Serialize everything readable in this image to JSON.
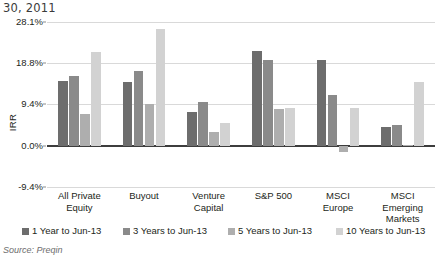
{
  "heading": "30, 2011",
  "source_note": "Source: Preqin",
  "chart_data": {
    "type": "bar",
    "title": "30, 2011",
    "xlabel": "",
    "ylabel": "IRR",
    "ylim": [
      -9.4,
      28.1
    ],
    "grid": true,
    "legend_position": "bottom",
    "ytick_labels": [
      "28.1%",
      "18.8%",
      "9.4%",
      "0.0%",
      "-9.4%"
    ],
    "ytick_values": [
      28.1,
      18.8,
      9.4,
      0.0,
      -9.4
    ],
    "categories": [
      "All Private Equity",
      "Buyout",
      "Venture Capital",
      "S&P 500",
      "MSCI Europe",
      "MSCI Emerging Markets"
    ],
    "category_lines": [
      [
        "All Private",
        "Equity"
      ],
      [
        "Buyout"
      ],
      [
        "Venture",
        "Capital"
      ],
      [
        "S&P 500"
      ],
      [
        "MSCI",
        "Europe"
      ],
      [
        "MSCI",
        "Emerging",
        "Markets"
      ]
    ],
    "series": [
      {
        "name": "1 Year to Jun-13",
        "color": "#6d6d6d",
        "values": [
          14.8,
          14.5,
          7.7,
          21.5,
          19.4,
          4.3
        ]
      },
      {
        "name": "3 Years to Jun-13",
        "color": "#8a8a8a",
        "values": [
          15.8,
          17.0,
          9.9,
          19.4,
          11.6,
          4.7
        ]
      },
      {
        "name": "5 Years to Jun-13",
        "color": "#aeaeae",
        "values": [
          7.1,
          9.4,
          3.2,
          8.3,
          -1.5,
          0.2
        ]
      },
      {
        "name": "10 Years to Jun-13",
        "color": "#d2d2d2",
        "values": [
          21.2,
          26.6,
          5.1,
          8.5,
          8.5,
          14.5
        ]
      }
    ]
  }
}
